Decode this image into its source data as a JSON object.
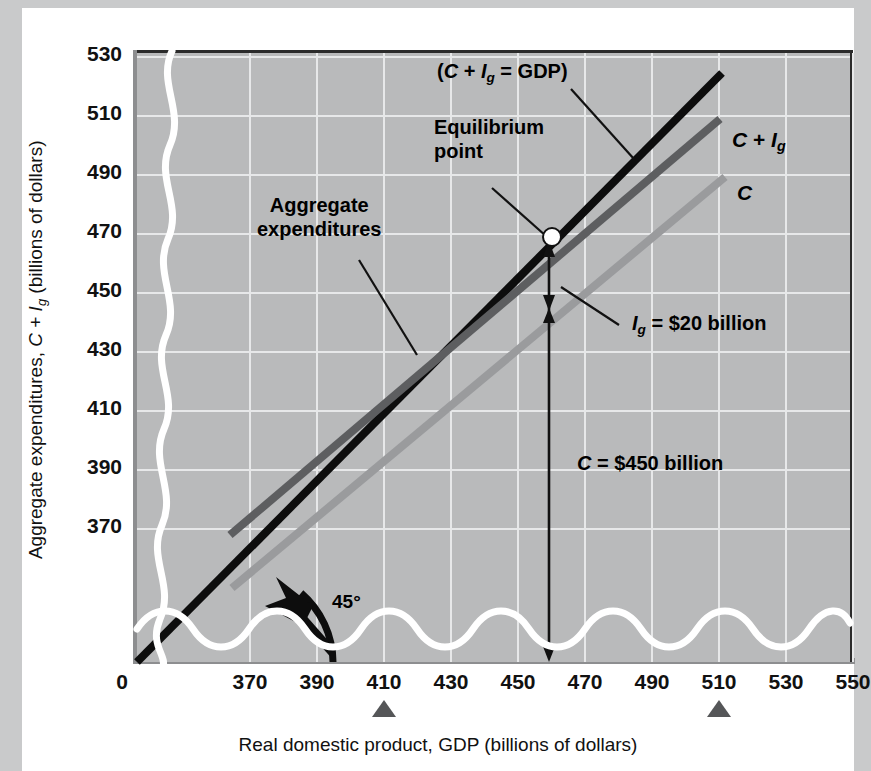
{
  "chart_data": {
    "type": "line",
    "title": "",
    "xlabel": "Real domestic product, GDP (billions of dollars)",
    "ylabel": "Aggregate expenditures, C + Ig (billions of dollars)",
    "xlabel_parts": {
      "pre": "Real domestic product, GDP (billions of dollars)"
    },
    "ylabel_parts": {
      "pre": "Aggregate expenditures, ",
      "c": "C",
      "plus": " + ",
      "i": "I",
      "g": "g",
      "post": " (billions of dollars)"
    },
    "xlim": [
      360,
      560
    ],
    "ylim": [
      360,
      540
    ],
    "xticks": [
      "370",
      "390",
      "410",
      "430",
      "450",
      "470",
      "490",
      "510",
      "530",
      "550"
    ],
    "xtick_values": [
      370,
      390,
      410,
      430,
      450,
      470,
      490,
      510,
      530,
      550
    ],
    "yticks": [
      "370",
      "390",
      "410",
      "430",
      "450",
      "470",
      "490",
      "510",
      "530"
    ],
    "ytick_values": [
      370,
      390,
      410,
      430,
      450,
      470,
      490,
      510,
      530
    ],
    "origin_label": "0",
    "grid": true,
    "axis_break": "wavy-break-on-both-axes",
    "legend_position": "inline-right-of-line-ends",
    "series": [
      {
        "name": "C + Ig = GDP",
        "label": "(C + Ig = GDP)",
        "role": "45-degree reference line",
        "color": "#0d0d0d",
        "width": 7,
        "points": [
          [
            362,
            362
          ],
          [
            545,
            545
          ]
        ]
      },
      {
        "name": "C + Ig",
        "label": "C + Ig",
        "role": "aggregate expenditures schedule",
        "color": "#5d5e60",
        "width": 7,
        "points": [
          [
            388,
            388
          ],
          [
            550,
            510
          ]
        ]
      },
      {
        "name": "C",
        "label": "C",
        "role": "consumption schedule",
        "color": "#9a9b9d",
        "width": 7,
        "points": [
          [
            388,
            370
          ],
          [
            551,
            492
          ]
        ]
      }
    ],
    "equilibrium": {
      "label": "Equilibrium\npoint",
      "label_line1": "Equilibrium",
      "label_line2": "point",
      "x": 470,
      "y": 470,
      "marker": "open-circle-white"
    },
    "annotations": [
      {
        "name": "aggregate-expenditures",
        "line1": "Aggregate",
        "line2": "expenditures"
      },
      {
        "name": "gdp-line-label",
        "text": "(C + Ig = GDP)"
      },
      {
        "name": "investment-gap",
        "text": "Ig = $20 billion",
        "value": 20
      },
      {
        "name": "consumption-level",
        "text": "C = $450 billion",
        "value": 450
      },
      {
        "name": "angle-label",
        "text": "45°"
      }
    ],
    "markers_below_axis": [
      410,
      510
    ],
    "series_labels": {
      "gdp": "C + Ig = GDP",
      "ci": "C + Ig",
      "c": "C"
    }
  },
  "labels": {
    "gdp_paren_open": "(",
    "gdp_paren_close": ")",
    "C": "C",
    "plus": " + ",
    "I": "I",
    "g": "g",
    "eq_gdp": " = GDP",
    "equilibrium_line1": "Equilibrium",
    "equilibrium_line2": "point",
    "agg_line1": "Aggregate",
    "agg_line2": "expenditures",
    "ig_eq": " = $20 billion",
    "c_eq": " = $450 billion",
    "angle": "45°",
    "origin": "0"
  }
}
